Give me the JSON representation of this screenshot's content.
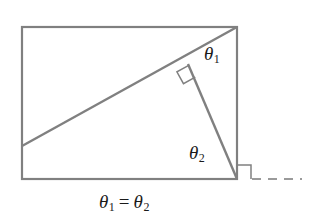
{
  "figure": {
    "background_color": "#ffffff",
    "line_color": "#808080",
    "text_color": "#1a1a1a",
    "stroke_width": 2.2,
    "canvas": {
      "width": 310,
      "height": 221
    }
  },
  "rectangle": {
    "name": "bounding-rectangle",
    "x": 22,
    "y": 27,
    "width": 215,
    "height": 152,
    "corners": {
      "top_left": [
        22,
        27
      ],
      "top_right": [
        237,
        27
      ],
      "bottom_right": [
        237,
        179
      ],
      "bottom_left": [
        22,
        179
      ]
    }
  },
  "segments": [
    {
      "name": "diagonal-hypotenuse",
      "from": [
        22,
        146
      ],
      "to": [
        237,
        27
      ]
    },
    {
      "name": "altitude-to-corner",
      "from": [
        188,
        64
      ],
      "to": [
        237,
        179
      ]
    }
  ],
  "dashed_extension": {
    "name": "baseline-extension",
    "from": [
      252,
      179
    ],
    "to": [
      302,
      179
    ],
    "dash_pattern": "9 7"
  },
  "right_angle_marks": [
    {
      "name": "right-angle-mark-foot",
      "vertex": [
        188,
        64
      ],
      "size": 13,
      "rotation_deg": -29
    },
    {
      "name": "right-angle-mark-corner",
      "vertex": [
        237,
        179
      ],
      "size": 13,
      "rotation_deg": 0
    }
  ],
  "labels": {
    "theta1": {
      "symbol": "θ",
      "subscript": "1",
      "text": "θ₁"
    },
    "theta2": {
      "symbol": "θ",
      "subscript": "2",
      "text": "θ₂"
    }
  },
  "caption": {
    "name": "equation-caption",
    "left_symbol": "θ",
    "left_subscript": "1",
    "operator": "=",
    "right_symbol": "θ",
    "right_subscript": "2",
    "full_text": "θ₁ = θ₂"
  }
}
